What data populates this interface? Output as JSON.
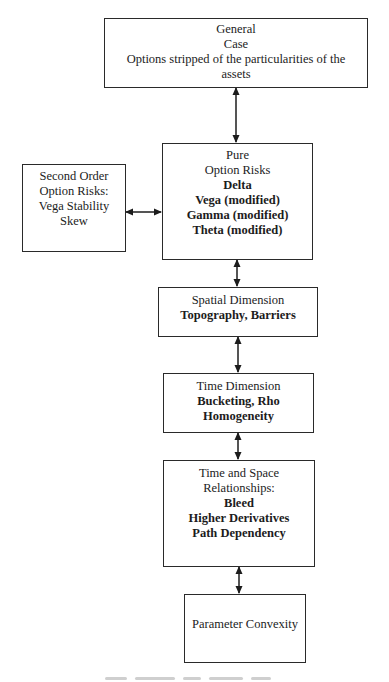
{
  "diagram": {
    "type": "flowchart",
    "nodes": {
      "general_case": {
        "lines": [
          {
            "text": "General",
            "bold": false
          },
          {
            "text": "Case",
            "bold": false
          },
          {
            "text": "Options stripped of the particularities of the",
            "bold": false
          },
          {
            "text": "assets",
            "bold": false
          }
        ]
      },
      "pure_option_risks": {
        "lines": [
          {
            "text": "Pure",
            "bold": false
          },
          {
            "text": "Option Risks",
            "bold": false
          },
          {
            "text": "Delta",
            "bold": true
          },
          {
            "text": "Vega (modified)",
            "bold": true
          },
          {
            "text": "Gamma (modified)",
            "bold": true
          },
          {
            "text": "Theta (modified)",
            "bold": true
          }
        ]
      },
      "second_order_option_risks": {
        "lines": [
          {
            "text": "Second Order",
            "bold": false
          },
          {
            "text": "Option Risks:",
            "bold": false
          },
          {
            "text": "Vega Stability",
            "bold": false
          },
          {
            "text": "Skew",
            "bold": false
          }
        ]
      },
      "spatial_dimension": {
        "lines": [
          {
            "text": "Spatial Dimension",
            "bold": false
          },
          {
            "text": "Topography, Barriers",
            "bold": true
          }
        ]
      },
      "time_dimension": {
        "lines": [
          {
            "text": "Time Dimension",
            "bold": false
          },
          {
            "text": "Bucketing, Rho",
            "bold": true
          },
          {
            "text": "Homogeneity",
            "bold": true
          }
        ]
      },
      "time_and_space_relationships": {
        "lines": [
          {
            "text": "Time and Space",
            "bold": false
          },
          {
            "text": "Relationships:",
            "bold": false
          },
          {
            "text": "Bleed",
            "bold": true
          },
          {
            "text": "Higher Derivatives",
            "bold": true
          },
          {
            "text": "Path Dependency",
            "bold": true
          }
        ]
      },
      "parameter_convexity": {
        "lines": [
          {
            "text": "Parameter Convexity",
            "bold": false
          }
        ]
      }
    },
    "edges": [
      {
        "from": "general_case",
        "to": "pure_option_risks",
        "type": "bidirectional"
      },
      {
        "from": "second_order_option_risks",
        "to": "pure_option_risks",
        "type": "bidirectional"
      },
      {
        "from": "pure_option_risks",
        "to": "spatial_dimension",
        "type": "bidirectional"
      },
      {
        "from": "spatial_dimension",
        "to": "time_dimension",
        "type": "bidirectional"
      },
      {
        "from": "time_dimension",
        "to": "time_and_space_relationships",
        "type": "bidirectional"
      },
      {
        "from": "time_and_space_relationships",
        "to": "parameter_convexity",
        "type": "bidirectional"
      }
    ],
    "colors": {
      "border": "#2a2a2a",
      "text": "#1c1c1c",
      "background": "#ffffff"
    }
  }
}
